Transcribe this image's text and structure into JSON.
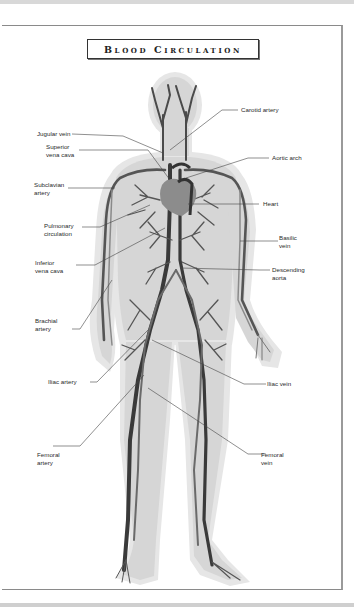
{
  "title": "Blood Circulation",
  "labels": {
    "jugular_vein": "Jugular vein",
    "superior_vena_cava": "Superior\nvena cava",
    "subclavian_artery": "Subclavian\nartery",
    "pulmonary_circulation": "Pulmonary\ncirculation",
    "inferior_vena_cava": "Inferior\nvena cava",
    "brachial_artery": "Brachial\nartery",
    "iliac_artery": "Iliac artery",
    "femoral_artery": "Femoral\nartery",
    "carotid_artery": "Carotid artery",
    "aortic_arch": "Aortic arch",
    "heart": "Heart",
    "basilic_vein": "Basilic\nvein",
    "descending_aorta": "Descending\naorta",
    "iliac_vein": "Iliac vein",
    "femoral_vein": "Femoral\nvein"
  },
  "colors": {
    "body_fill": "#d9d9d9",
    "body_halo": "#e8e8e8",
    "vessel_dark": "#3c3c3c",
    "vessel_mid": "#6e6e6e",
    "vessel_light": "#9a9a9a",
    "heart": "#8a8a8a",
    "leader_line": "#444444"
  }
}
